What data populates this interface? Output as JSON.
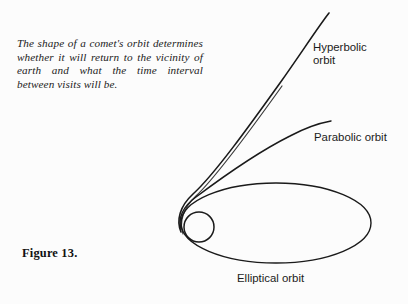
{
  "figure": {
    "number_label": "Figure 13.",
    "caption": "The shape of a comet's orbit determines whether it will return to the vicinity of earth and what the time interval between visits will be.",
    "background_color": "#fcfcfc",
    "stroke_color": "#1a1a1a"
  },
  "labels": {
    "hyperbolic": "Hyperbolic\norbit",
    "parabolic": "Parabolic orbit",
    "elliptical": "Elliptical orbit"
  },
  "diagram": {
    "type": "conic-section-orbit-diagram",
    "focus_body": {
      "name": "sun-circle",
      "center_x": 199,
      "center_y": 227,
      "radius": 15
    },
    "perihelion_point": {
      "x": 181,
      "y": 226
    },
    "curves": [
      {
        "name": "elliptical-orbit",
        "shape": "ellipse",
        "center_x": 276,
        "center_y": 223,
        "rx": 95,
        "ry": 40
      },
      {
        "name": "parabolic-orbit",
        "shape": "open-curve",
        "start": {
          "x": 181,
          "y": 228
        },
        "end": {
          "x": 331,
          "y": 121
        }
      },
      {
        "name": "hyperbolic-orbit",
        "shape": "open-curve",
        "start": {
          "x": 181,
          "y": 230
        },
        "end": {
          "x": 329,
          "y": 13
        }
      }
    ]
  }
}
